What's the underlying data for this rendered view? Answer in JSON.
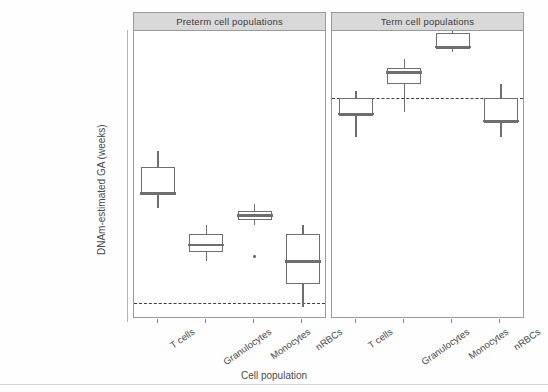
{
  "chart_data": {
    "type": "box",
    "title": "",
    "xlabel": "Cell population",
    "ylabel": "DNAm-estimated GA (weeks)",
    "ylim": [
      28.4,
      40.9
    ],
    "yticks": [
      30,
      33,
      36,
      39
    ],
    "ytick_labels": [
      "30",
      "33",
      "36",
      "39"
    ],
    "grid": false,
    "legend": "none",
    "categories": [
      "T cells",
      "Granulocytes",
      "Monocytes",
      "nRBCs"
    ],
    "panels": [
      {
        "label": "Preterm cell populations",
        "reference_line": 29.1,
        "boxes": [
          {
            "category": "T cells",
            "whisker_low": 33.2,
            "q1": 33.8,
            "median": 33.85,
            "q3": 35.0,
            "whisker_high": 35.7,
            "outliers": []
          },
          {
            "category": "Granulocytes",
            "whisker_low": 30.9,
            "q1": 31.3,
            "median": 31.6,
            "q3": 32.1,
            "whisker_high": 32.5,
            "outliers": []
          },
          {
            "category": "Monocytes",
            "whisker_low": 32.5,
            "q1": 32.7,
            "median": 32.9,
            "q3": 33.1,
            "whisker_high": 33.4,
            "outliers": [
              31.1
            ]
          },
          {
            "category": "nRBCs",
            "whisker_low": 28.9,
            "q1": 29.9,
            "median": 30.9,
            "q3": 32.1,
            "whisker_high": 32.5,
            "outliers": []
          }
        ]
      },
      {
        "label": "Term cell populations",
        "reference_line": 38.0,
        "boxes": [
          {
            "category": "T cells",
            "whisker_low": 36.3,
            "q1": 37.2,
            "median": 37.3,
            "q3": 38.0,
            "whisker_high": 38.3,
            "outliers": []
          },
          {
            "category": "Granulocytes",
            "whisker_low": 37.4,
            "q1": 38.6,
            "median": 39.1,
            "q3": 39.3,
            "whisker_high": 39.7,
            "outliers": []
          },
          {
            "category": "Monocytes",
            "whisker_low": 40.0,
            "q1": 40.1,
            "median": 40.2,
            "q3": 40.8,
            "whisker_high": 41.1,
            "outliers": []
          },
          {
            "category": "nRBCs",
            "whisker_low": 36.3,
            "q1": 36.9,
            "median": 37.0,
            "q3": 38.0,
            "whisker_high": 38.6,
            "outliers": []
          }
        ]
      }
    ],
    "colors": {
      "box_stroke": "#6e6e6e",
      "box_fill": "#ffffff",
      "median": "#6e6e6e",
      "reference_line": "#3d3d3d",
      "strip_background": "#d9d9d9",
      "axis": "#8a8a8a",
      "text": "#4a4a4a",
      "background": "#ffffff"
    }
  }
}
